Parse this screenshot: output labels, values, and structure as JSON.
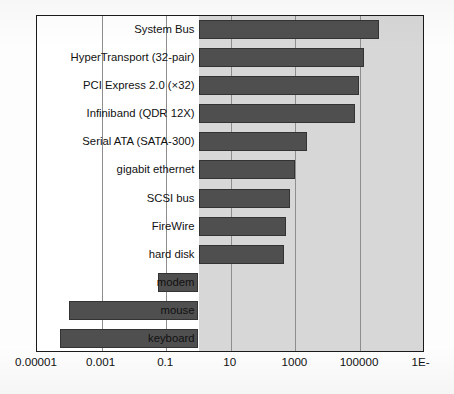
{
  "chart_data": {
    "type": "bar",
    "orientation": "horizontal",
    "title": "",
    "xlabel": "",
    "ylabel": "",
    "xscale": "log",
    "xlim": [
      1e-05,
      10000000
    ],
    "xticks": [
      1e-05,
      0.001,
      0.1,
      10,
      1000,
      100000,
      10000000
    ],
    "xtick_labels": [
      "0.00001",
      "0.001",
      "0.1",
      "10",
      "1000",
      "100000",
      "1E-"
    ],
    "grid": true,
    "legend": false,
    "bar_baseline": 1,
    "categories": [
      "System Bus",
      "HyperTransport (32-pair)",
      "PCI Express 2.0 (×32)",
      "Infiniband (QDR 12X)",
      "Serial ATA (SATA-300)",
      "gigabit ethernet",
      "SCSI bus",
      "FireWire",
      "hard disk",
      "modem",
      "mouse",
      "keyboard"
    ],
    "values": [
      400000,
      130000,
      96000,
      71000,
      2200,
      1000,
      700,
      500,
      430,
      0.055,
      0.0001,
      5e-05
    ],
    "bars": [
      {
        "label": "System Bus",
        "value": 400000,
        "direction": "right",
        "label_inside": false
      },
      {
        "label": "HyperTransport (32-pair)",
        "value": 130000,
        "direction": "right",
        "label_inside": false
      },
      {
        "label": "PCI Express 2.0 (×32)",
        "value": 96000,
        "direction": "right",
        "label_inside": false
      },
      {
        "label": "Infiniband (QDR 12X)",
        "value": 71000,
        "direction": "right",
        "label_inside": false
      },
      {
        "label": "Serial ATA (SATA-300)",
        "value": 2200,
        "direction": "right",
        "label_inside": false
      },
      {
        "label": "gigabit ethernet",
        "value": 1000,
        "direction": "right",
        "label_inside": false
      },
      {
        "label": "SCSI bus",
        "value": 700,
        "direction": "right",
        "label_inside": false
      },
      {
        "label": "FireWire",
        "value": 500,
        "direction": "right",
        "label_inside": false
      },
      {
        "label": "hard disk",
        "value": 430,
        "direction": "right",
        "label_inside": false
      },
      {
        "label": "modem",
        "value": 0.055,
        "direction": "left",
        "label_inside": true
      },
      {
        "label": "mouse",
        "value": 0.0001,
        "direction": "left",
        "label_inside": true
      },
      {
        "label": "keyboard",
        "value": 5e-05,
        "direction": "left",
        "label_inside": true
      }
    ],
    "colors": {
      "bar_fill": "#4f4f4f",
      "bar_edge": "#333333",
      "plot_shade": "#d7d7d7",
      "plot_background": "#ffffff",
      "frame": "#1a1a1a",
      "gridline": "#8e8e8e",
      "text": "#111111"
    }
  },
  "axis": {
    "tick_labels": [
      "0.00001",
      "0.001",
      "0.1",
      "10",
      "1000",
      "100000",
      "1E-"
    ]
  }
}
